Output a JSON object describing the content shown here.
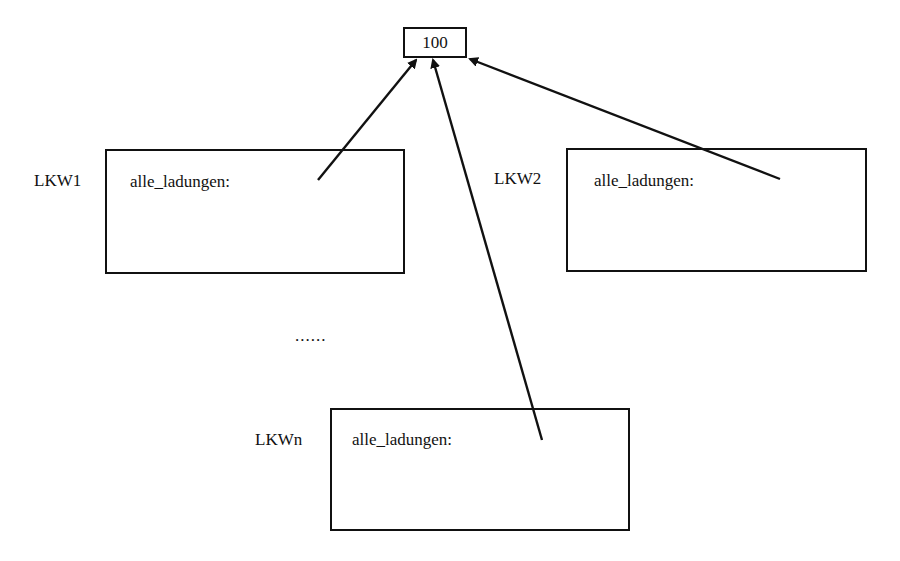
{
  "diagram": {
    "shared_value": {
      "text": "100"
    },
    "objects": [
      {
        "name": "LKW1",
        "attribute": "alle_ladungen:"
      },
      {
        "name": "LKW2",
        "attribute": "alle_ladungen:"
      },
      {
        "name": "LKWn",
        "attribute": "alle_ladungen:"
      }
    ],
    "ellipsis": "......",
    "edges": [
      {
        "from": "LKW1.alle_ladungen",
        "to": "100"
      },
      {
        "from": "LKW2.alle_ladungen",
        "to": "100"
      },
      {
        "from": "LKWn.alle_ladungen",
        "to": "100"
      }
    ],
    "colors": {
      "stroke": "#111111",
      "background": "#ffffff"
    }
  }
}
